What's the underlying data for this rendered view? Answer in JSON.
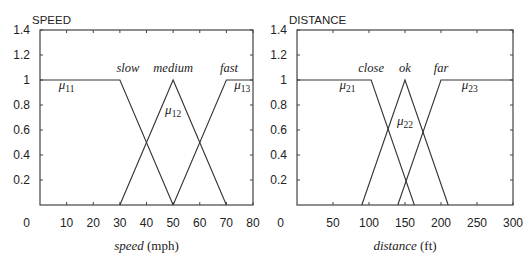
{
  "chart_data": [
    {
      "type": "line",
      "title": "SPEED",
      "xlabel_italic": "speed",
      "xlabel_unit": "(mph)",
      "ylabel": "",
      "xlim": [
        0,
        80
      ],
      "ylim": [
        0,
        1.4
      ],
      "x_ticks": [
        0,
        10,
        20,
        30,
        40,
        50,
        60,
        70,
        80
      ],
      "y_ticks": [
        0.2,
        0.4,
        0.6,
        0.8,
        1,
        1.2,
        1.4
      ],
      "grid": false,
      "series": [
        {
          "name": "slow",
          "mu": "11",
          "points": [
            [
              0,
              1
            ],
            [
              30,
              1
            ],
            [
              50,
              0
            ]
          ]
        },
        {
          "name": "medium",
          "mu": "12",
          "points": [
            [
              30,
              0
            ],
            [
              50,
              1
            ],
            [
              70,
              0
            ]
          ]
        },
        {
          "name": "fast",
          "mu": "13",
          "points": [
            [
              50,
              0
            ],
            [
              70,
              1
            ],
            [
              80,
              1
            ]
          ]
        }
      ],
      "annotations": [
        {
          "text": "slow",
          "x": 33,
          "y": 1.1
        },
        {
          "text": "medium",
          "x": 50,
          "y": 1.1
        },
        {
          "text": "fast",
          "x": 71,
          "y": 1.1
        },
        {
          "text": "μ11",
          "x": 10,
          "y": 0.93
        },
        {
          "text": "μ12",
          "x": 50,
          "y": 0.73
        },
        {
          "text": "μ13",
          "x": 76,
          "y": 0.93
        }
      ]
    },
    {
      "type": "line",
      "title": "DISTANCE",
      "xlabel_italic": "distance",
      "xlabel_unit": "(ft)",
      "ylabel": "",
      "xlim": [
        0,
        300
      ],
      "ylim": [
        0,
        1.4
      ],
      "x_ticks": [
        0,
        50,
        100,
        150,
        200,
        250,
        300
      ],
      "y_ticks": [
        0.2,
        0.4,
        0.6,
        0.8,
        1,
        1.2,
        1.4
      ],
      "grid": false,
      "series": [
        {
          "name": "close",
          "mu": "21",
          "points": [
            [
              0,
              1
            ],
            [
              103,
              1
            ],
            [
              163,
              0
            ]
          ]
        },
        {
          "name": "ok",
          "mu": "22",
          "points": [
            [
              90,
              0
            ],
            [
              150,
              1
            ],
            [
              210,
              0
            ]
          ]
        },
        {
          "name": "far",
          "mu": "23",
          "points": [
            [
              140,
              0
            ],
            [
              200,
              1
            ],
            [
              300,
              1
            ]
          ]
        }
      ],
      "annotations": [
        {
          "text": "close",
          "x": 103,
          "y": 1.1
        },
        {
          "text": "ok",
          "x": 150,
          "y": 1.1
        },
        {
          "text": "far",
          "x": 200,
          "y": 1.1
        },
        {
          "text": "μ21",
          "x": 70,
          "y": 0.93
        },
        {
          "text": "μ22",
          "x": 150,
          "y": 0.64
        },
        {
          "text": "μ23",
          "x": 240,
          "y": 0.93
        }
      ]
    }
  ]
}
